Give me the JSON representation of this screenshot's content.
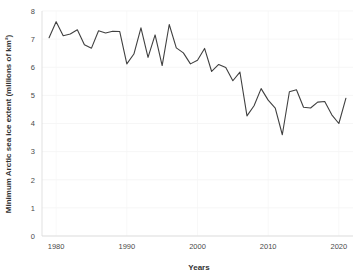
{
  "chart_data": {
    "type": "line",
    "title": "",
    "xlabel": "Years",
    "ylabel": "Minimum Arctic sea ice extent (millions of km²)",
    "xlim": [
      1978,
      2022
    ],
    "ylim": [
      0,
      8
    ],
    "grid": true,
    "legend": "none",
    "x_tick_labels": [
      "1980",
      "1990",
      "2000",
      "2010",
      "2020"
    ],
    "x_ticks": [
      1980,
      1990,
      2000,
      2010,
      2020
    ],
    "y_tick_labels": [
      "0",
      "1",
      "2",
      "3",
      "4",
      "5",
      "6",
      "7",
      "8"
    ],
    "y_ticks": [
      0,
      1,
      2,
      3,
      4,
      5,
      6,
      7,
      8
    ],
    "series": [
      {
        "name": "Minimum Arctic sea ice extent",
        "color": "#404040",
        "x": [
          1979,
          1980,
          1981,
          1982,
          1983,
          1984,
          1985,
          1986,
          1987,
          1988,
          1989,
          1990,
          1991,
          1992,
          1993,
          1994,
          1995,
          1996,
          1997,
          1998,
          1999,
          2000,
          2001,
          2002,
          2003,
          2004,
          2005,
          2006,
          2007,
          2008,
          2009,
          2010,
          2011,
          2012,
          2013,
          2014,
          2015,
          2016,
          2017,
          2018,
          2019,
          2020,
          2021
        ],
        "values": [
          7.05,
          7.62,
          7.12,
          7.18,
          7.33,
          6.8,
          6.68,
          7.3,
          7.22,
          7.28,
          7.27,
          6.12,
          6.47,
          7.4,
          6.35,
          7.15,
          6.06,
          7.52,
          6.69,
          6.51,
          6.12,
          6.25,
          6.67,
          5.85,
          6.1,
          5.99,
          5.52,
          5.83,
          4.27,
          4.63,
          5.24,
          4.83,
          4.55,
          3.6,
          5.13,
          5.2,
          4.58,
          4.55,
          4.76,
          4.78,
          4.31,
          4.0,
          4.9
        ]
      }
    ]
  }
}
